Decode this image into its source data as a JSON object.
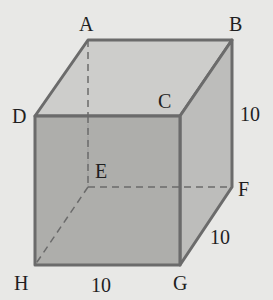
{
  "figure": {
    "type": "cube",
    "vertices": {
      "A": {
        "label": "A",
        "x": 88,
        "y": 40
      },
      "B": {
        "label": "B",
        "x": 232,
        "y": 40
      },
      "C": {
        "label": "C",
        "x": 180,
        "y": 116
      },
      "D": {
        "label": "D",
        "x": 35,
        "y": 116
      },
      "E": {
        "label": "E",
        "x": 88,
        "y": 187
      },
      "F": {
        "label": "F",
        "x": 232,
        "y": 187
      },
      "G": {
        "label": "G",
        "x": 180,
        "y": 265
      },
      "H": {
        "label": "H",
        "x": 35,
        "y": 265
      }
    },
    "dimensions": {
      "HG": "10",
      "GF": "10",
      "BF": "10"
    },
    "hidden_edges": [
      "AE",
      "EF",
      "EH"
    ],
    "colors": {
      "background": "#e8e8e6",
      "top_face": "#cdcdcb",
      "front_face": "#a8a8a6",
      "right_face": "#bdbdbb",
      "edge": "#6b6b6b",
      "text": "#1f1f1f"
    }
  }
}
